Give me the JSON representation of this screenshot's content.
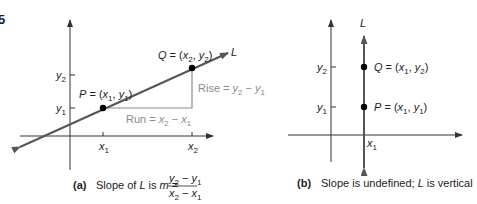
{
  "figure_number": "5",
  "panel_a": {
    "axes": {
      "x_tick_labels": [
        "x",
        "x"
      ],
      "x_tick_subs": [
        "1",
        "2"
      ],
      "y_tick_labels": [
        "y",
        "y"
      ],
      "y_tick_subs": [
        "1",
        "2"
      ]
    },
    "line_label": "L",
    "point_p": {
      "name": "P",
      "coords_text": "P = (x",
      "sub1": "1",
      "mid": ", y",
      "sub2": "1",
      "end": ")"
    },
    "point_q": {
      "name": "Q",
      "coords_text": "Q = (x",
      "sub1": "2",
      "mid": ", y",
      "sub2": "2",
      "end": ")"
    },
    "rise_label": {
      "text": "Rise = y",
      "sub1": "2",
      "mid": " − y",
      "sub2": "1"
    },
    "run_label": {
      "text": "Run = x",
      "sub1": "2",
      "mid": " − x",
      "sub2": "1"
    },
    "caption": {
      "tag": "(a)",
      "text": "Slope of ",
      "L": "L",
      "is": " is ",
      "m": "m",
      "eq": " =",
      "numerator": {
        "a": "y",
        "a_sub": "2",
        "op": " − y",
        "b_sub": "1"
      },
      "denominator": {
        "a": "x",
        "a_sub": "2",
        "op": " − x",
        "b_sub": "1"
      }
    },
    "colors": {
      "line": "#555555",
      "axis": "#333333",
      "helper": "#8a8a8a",
      "point": "#000000"
    }
  },
  "panel_b": {
    "line_label": "L",
    "x_tick_label": "x",
    "x_tick_sub": "1",
    "y_tick_labels": [
      "y",
      "y"
    ],
    "y_tick_subs": [
      "2",
      "1"
    ],
    "point_q": {
      "coords_text": "Q = (x",
      "sub1": "1",
      "mid": ", y",
      "sub2": "2",
      "end": ")"
    },
    "point_p": {
      "coords_text": "P = (x",
      "sub1": "1",
      "mid": ", y",
      "sub2": "1",
      "end": ")"
    },
    "caption": {
      "tag": "(b)",
      "text1": "Slope is undefined; ",
      "L": "L",
      "text2": " is vertical"
    }
  }
}
